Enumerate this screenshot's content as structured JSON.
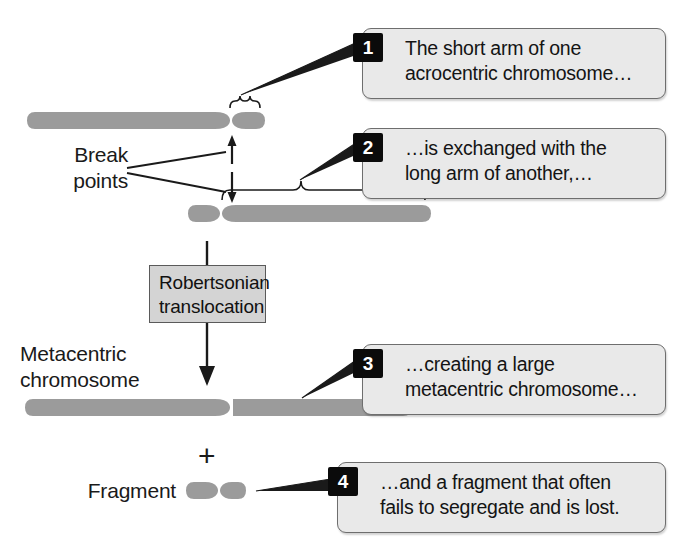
{
  "figure": {
    "background": "#ffffff",
    "chromosome_color": "#9b9b9b",
    "callout_fill": "#e9e9e9",
    "callout_border": "#6e6e6e",
    "badge_fill": "#0b0b0b",
    "process_fill": "#d4d4d4",
    "line_color": "#1a1a1a"
  },
  "labels": {
    "break_points": "Break\npoints",
    "metacentric_chromosome": "Metacentric\nchromosome",
    "fragment": "Fragment",
    "plus": "+"
  },
  "process": {
    "label": "Robertsonian\ntranslocation"
  },
  "callouts": [
    {
      "number": "1",
      "text": "The short arm of one\nacrocentric chromosome…"
    },
    {
      "number": "2",
      "text": "…is exchanged with the\nlong arm of another,…"
    },
    {
      "number": "3",
      "text": "…creating a large\nmetacentric chromosome…"
    },
    {
      "number": "4",
      "text": "…and a fragment that often\nfails to segregate and is lost."
    }
  ],
  "structures": {
    "acrocentric_chromosome_1": "long left arm with centromere near right end and a short right arm",
    "acrocentric_chromosome_2": "short left arm with centromere near left end and a long right arm",
    "metacentric_chromosome": "large chromosome with central centromere",
    "fragment": "small two-lobed fragment"
  }
}
